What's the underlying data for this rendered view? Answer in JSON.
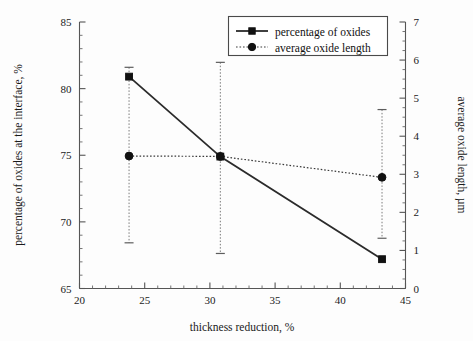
{
  "chart_data": {
    "type": "line",
    "title": "",
    "xlabel": "thickness reduction, %",
    "ylabel": "percentage of oxides at the interface, %",
    "y2label": "average oxide length, µm",
    "xlim": [
      20,
      45
    ],
    "ylim": [
      65,
      85
    ],
    "y2lim": [
      0,
      7
    ],
    "grid": false,
    "legend_position": "top-right",
    "x_ticks": [
      20,
      25,
      30,
      35,
      40,
      45
    ],
    "x_tick_labels": [
      "20",
      "25",
      "30",
      "35",
      "40",
      "45"
    ],
    "x_minor_step": 1,
    "y_ticks": [
      65,
      70,
      75,
      80,
      85
    ],
    "y_tick_labels": [
      "65",
      "70",
      "75",
      "80",
      "85"
    ],
    "y_minor_step": 1,
    "y2_ticks": [
      0,
      1,
      2,
      3,
      4,
      5,
      6,
      7
    ],
    "y2_tick_labels": [
      "0",
      "1",
      "2",
      "3",
      "4",
      "5",
      "6",
      "7"
    ],
    "y2_minor_step": 0.25,
    "x": [
      23.8,
      30.8,
      43.2
    ],
    "series": [
      {
        "name": "percentage of oxides",
        "axis": "left",
        "marker": "square",
        "linestyle": "solid",
        "values": [
          80.9,
          74.9,
          67.2
        ],
        "errors_low": [
          null,
          null,
          null
        ],
        "errors_high": [
          null,
          null,
          null
        ]
      },
      {
        "name": "average oxide length",
        "axis": "right",
        "marker": "circle",
        "linestyle": "dotted",
        "values": [
          3.48,
          3.47,
          2.92
        ],
        "errors_low": [
          2.28,
          2.55,
          1.6
        ],
        "errors_high": [
          2.33,
          2.47,
          1.78
        ]
      }
    ]
  },
  "legend": {
    "entries": [
      {
        "label": "percentage of oxides",
        "marker": "square",
        "linestyle": "solid"
      },
      {
        "label": "average oxide length",
        "marker": "circle",
        "linestyle": "dotted"
      }
    ]
  },
  "axes": {
    "x_title": "thickness reduction, %",
    "y_left_title": "percentage of oxides at the interface, %",
    "y_right_title": "average oxide length, µm"
  },
  "ticks": {
    "x": [
      "20",
      "25",
      "30",
      "35",
      "40",
      "45"
    ],
    "y_left": [
      "65",
      "70",
      "75",
      "80",
      "85"
    ],
    "y_right": [
      "0",
      "1",
      "2",
      "3",
      "4",
      "5",
      "6",
      "7"
    ]
  },
  "colors": {
    "series_primary": "#111111",
    "series_secondary": "#3a3a3a",
    "error_bar": "#7a7a7a",
    "axis": "#555555",
    "background": "#fdfdfd"
  }
}
